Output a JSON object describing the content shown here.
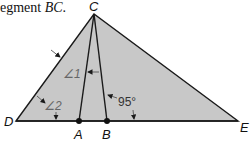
{
  "caption": {
    "prefix": "egment ",
    "segment": "BC",
    "suffix": "."
  },
  "figure": {
    "fill_color": "#c8c8c8",
    "stroke_color": "#1a1a1a",
    "points": {
      "C": "C",
      "D": "D",
      "E": "E",
      "A": "A",
      "B": "B"
    },
    "angles": {
      "angle1": "∠1",
      "angle2": "∠2",
      "angle_95": "95°"
    }
  }
}
